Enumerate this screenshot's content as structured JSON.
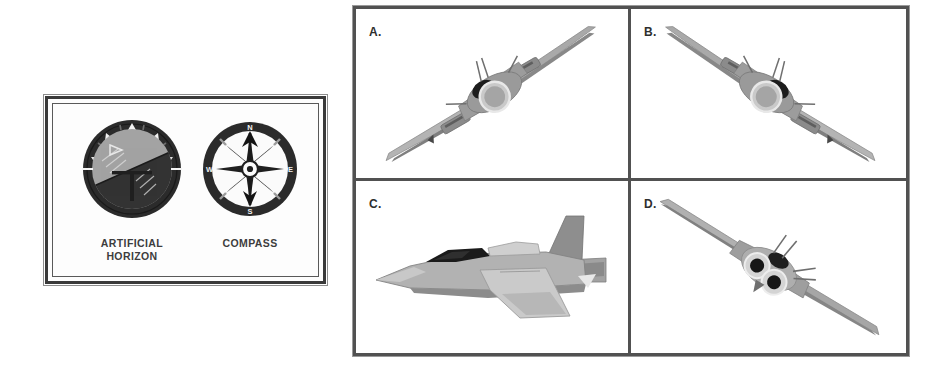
{
  "background_color": "#ffffff",
  "instrument_panel": {
    "border_color": "#3a3a3a",
    "instruments": [
      {
        "id": "artificial-horizon",
        "label_line1": "ARTIFICIAL",
        "label_line2": "HORIZON",
        "bezel_color": "#2b2b2b",
        "sky_color": "#a0a0a0",
        "ground_color": "#2f2f2f",
        "horizon_tilt_degrees": -24,
        "marker_count": 5
      },
      {
        "id": "compass",
        "label_line1": "COMPASS",
        "label_line2": "",
        "bezel_color": "#2b2b2b",
        "face_color": "#fbfbfb",
        "cardinal_points": [
          "N",
          "E",
          "S",
          "W"
        ],
        "needle_heading": "N",
        "rose_points": 8
      }
    ]
  },
  "answer_grid": {
    "border_color": "#515151",
    "columns": 2,
    "rows": 2,
    "cells": [
      {
        "label": "A.",
        "view": "front-view-banked-right",
        "description": "Jet fighter seen from the front, banked with left wing low and right wing high",
        "bank_degrees": -30
      },
      {
        "label": "B.",
        "view": "front-view-banked-left",
        "description": "Jet fighter seen from the front, banked with left wing high and right wing low",
        "bank_degrees": 30
      },
      {
        "label": "C.",
        "view": "side-profile-level",
        "description": "Jet fighter in side profile, level flight, nose pointing left",
        "bank_degrees": 0
      },
      {
        "label": "D.",
        "view": "rear-view-banked-left",
        "description": "Jet fighter seen from behind showing two exhaust nozzles, banked with left wing high and right wing low",
        "bank_degrees": 30
      }
    ]
  },
  "palette": {
    "plane_light": "#c9c9c9",
    "plane_mid": "#9d9d9d",
    "plane_dark": "#6f6f6f",
    "plane_darkest": "#2d2d2d",
    "outline": "#7b7b7b",
    "canopy": "#1d1d1d"
  }
}
